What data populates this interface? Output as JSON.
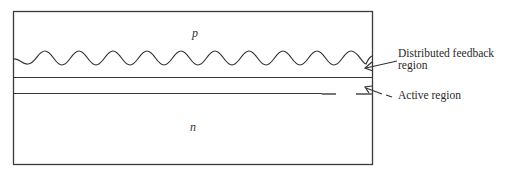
{
  "diagram": {
    "regions": {
      "top_label": "p",
      "bottom_label": "n"
    },
    "annotations": [
      {
        "id": "dfb",
        "lines": [
          "Distributed feedback",
          "region"
        ],
        "arrow_style": "solid"
      },
      {
        "id": "active",
        "lines": [
          "Active region"
        ],
        "arrow_style": "dashed"
      }
    ],
    "colors": {
      "stroke": "#3a3a3a",
      "text": "#2a2a2a",
      "background": "#ffffff"
    }
  }
}
